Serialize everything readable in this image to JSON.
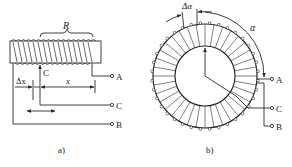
{
  "figure": {
    "subfigures": [
      {
        "id": "a",
        "caption": "a)",
        "type": "linear-wirewound-potentiometer",
        "labels": {
          "resistance": "R",
          "wiper": "C",
          "delta_x": "Δx",
          "x": "x",
          "terminal_a": "A",
          "terminal_c": "C",
          "terminal_b": "B"
        }
      },
      {
        "id": "b",
        "caption": "b)",
        "type": "rotary-wirewound-potentiometer",
        "labels": {
          "delta_alpha": "Δα",
          "alpha": "α",
          "terminal_a": "A",
          "terminal_c": "C",
          "terminal_b": "B"
        }
      }
    ]
  },
  "colors": {
    "stroke": "#2a2a2a",
    "background": "#ffffff"
  }
}
